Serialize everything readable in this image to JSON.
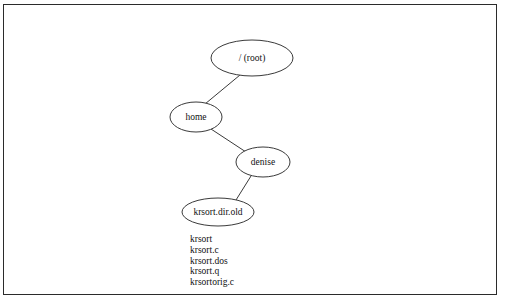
{
  "figure": {
    "kind": "directory-tree-diagram",
    "border_color": "#2b2b2b",
    "background_color": "#ffffff",
    "line_color": "#3a3a3a"
  },
  "tree": {
    "nodes": [
      {
        "id": "root",
        "label": "/ (root)",
        "cx": 252,
        "cy": 58,
        "rx": 41,
        "ry": 18
      },
      {
        "id": "home",
        "label": "home",
        "cx": 196,
        "cy": 117,
        "rx": 26,
        "ry": 15
      },
      {
        "id": "denise",
        "label": "denise",
        "cx": 263,
        "cy": 162,
        "rx": 27,
        "ry": 15
      },
      {
        "id": "krsortdirold",
        "label": "krsort.dir.old",
        "cx": 218,
        "cy": 212,
        "rx": 36,
        "ry": 14
      }
    ],
    "edges": [
      {
        "from": "root",
        "to": "home",
        "x1": 240,
        "y1": 75,
        "x2": 205,
        "y2": 104
      },
      {
        "from": "home",
        "to": "denise",
        "x1": 211,
        "y1": 129,
        "x2": 246,
        "y2": 152
      },
      {
        "from": "denise",
        "to": "krsortdirold",
        "x1": 251,
        "y1": 176,
        "x2": 236,
        "y2": 200
      }
    ]
  },
  "file_list": {
    "files": [
      "krsort",
      "krsort.c",
      "krsort.dos",
      "krsort.q",
      "krsortorig.c"
    ]
  }
}
